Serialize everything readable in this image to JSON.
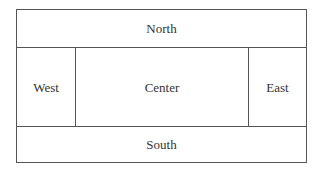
{
  "diagram": {
    "type": "border-layout",
    "regions": {
      "north": "North",
      "west": "West",
      "center": "Center",
      "east": "East",
      "south": "South"
    }
  }
}
